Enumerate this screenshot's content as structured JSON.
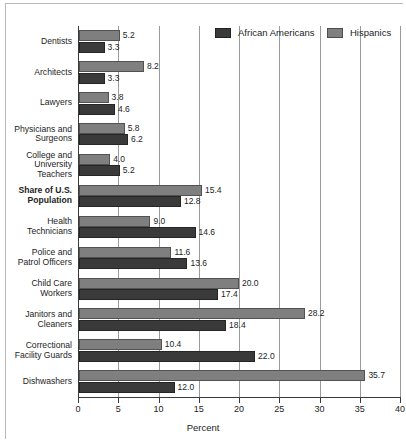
{
  "chart_data": {
    "type": "bar",
    "orientation": "horizontal",
    "title": "",
    "xlabel": "Percent",
    "ylabel": "",
    "xlim": [
      0,
      40
    ],
    "xticks": [
      0,
      5,
      10,
      15,
      20,
      25,
      30,
      35,
      40
    ],
    "grid": true,
    "legend_position": "top-right",
    "categories": [
      "Dentists",
      "Architects",
      "Lawyers",
      "Physicians and\nSurgeons",
      "College and\nUniversity\nTeachers",
      "Share of U.S.\nPopulation",
      "Health\nTechnicians",
      "Police and\nPatrol Officers",
      "Child Care\nWorkers",
      "Janitors and\nCleaners",
      "Correctional\nFacility Guards",
      "Dishwashers"
    ],
    "series": [
      {
        "name": "Hispanics",
        "color": "#7f7f7f",
        "values": [
          5.2,
          8.2,
          3.8,
          5.8,
          4.0,
          15.4,
          9.0,
          11.6,
          20.0,
          28.2,
          10.4,
          35.7
        ]
      },
      {
        "name": "African Americans",
        "color": "#3a3a3a",
        "values": [
          3.3,
          3.3,
          4.6,
          6.2,
          5.2,
          12.8,
          14.6,
          13.6,
          17.4,
          18.4,
          22.0,
          12.0
        ]
      }
    ],
    "value_labels": {
      "Dentists": {
        "Hispanics": "5.2",
        "African Americans": "3.3"
      },
      "Architects": {
        "Hispanics": "8.2",
        "African Americans": "3.3"
      },
      "Lawyers": {
        "Hispanics": "3.8",
        "African Americans": "4.6"
      },
      "Physicians and Surgeons": {
        "Hispanics": "5.8",
        "African Americans": "6.2"
      },
      "College and University Teachers": {
        "Hispanics": "4.0",
        "African Americans": "5.2"
      },
      "Share of U.S. Population": {
        "Hispanics": "15.4",
        "African Americans": "12.8"
      },
      "Health Technicians": {
        "Hispanics": "9.0",
        "African Americans": "14.6"
      },
      "Police and Patrol Officers": {
        "Hispanics": "11.6",
        "African Americans": "13.6"
      },
      "Child Care Workers": {
        "Hispanics": "20.0",
        "African Americans": "17.4"
      },
      "Janitors and Cleaners": {
        "Hispanics": "28.2",
        "African Americans": "18.4"
      },
      "Correctional Facility Guards": {
        "Hispanics": "10.4",
        "African Americans": "22.0"
      },
      "Dishwashers": {
        "Hispanics": "35.7",
        "African Americans": "12.0"
      }
    },
    "highlight_category": "Share of U.S.\nPopulation"
  },
  "legend": {
    "items": [
      {
        "label": "African Americans",
        "color": "#3a3a3a"
      },
      {
        "label": "Hispanics",
        "color": "#7f7f7f"
      }
    ]
  },
  "axis": {
    "x_title": "Percent",
    "tick_labels": [
      "0",
      "5",
      "10",
      "15",
      "20",
      "25",
      "30",
      "35",
      "40"
    ]
  }
}
